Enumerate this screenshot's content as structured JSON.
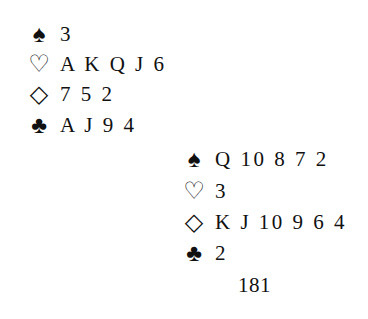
{
  "hands": [
    {
      "position": "top-left",
      "suits": [
        {
          "icon": "spade-icon",
          "glyph": "♠",
          "cards": "3"
        },
        {
          "icon": "heart-icon",
          "glyph": "♡",
          "cards": "A K Q J 6"
        },
        {
          "icon": "diamond-icon",
          "glyph": "◇",
          "cards": "7 5 2"
        },
        {
          "icon": "club-icon",
          "glyph": "♣",
          "cards": "A J 9 4"
        }
      ]
    },
    {
      "position": "bottom-right",
      "suits": [
        {
          "icon": "spade-icon",
          "glyph": "♠",
          "cards": "Q 10 8 7 2"
        },
        {
          "icon": "heart-icon",
          "glyph": "♡",
          "cards": "3"
        },
        {
          "icon": "diamond-icon",
          "glyph": "◇",
          "cards": "K J 10 9 6 4"
        },
        {
          "icon": "club-icon",
          "glyph": "♣",
          "cards": "2"
        }
      ]
    }
  ],
  "page_number": "181"
}
